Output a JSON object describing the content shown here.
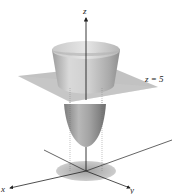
{
  "figure": {
    "axes": {
      "x_label": "x",
      "y_label": "y",
      "z_label": "z"
    },
    "plane_label": "z = 5",
    "colors": {
      "surface_light": "#d8d8d8",
      "surface_dark": "#8a8a8a",
      "plane": "#bdbdbd",
      "axis": "#222222",
      "shadow_disk": "#a8a8a8"
    }
  }
}
